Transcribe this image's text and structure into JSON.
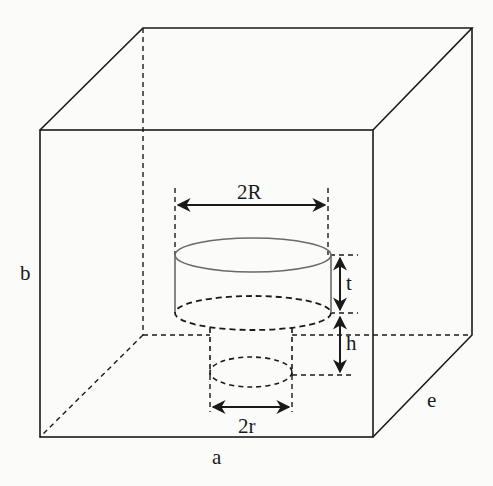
{
  "diagram": {
    "type": "3D box with stepped cylindrical cavity",
    "colors": {
      "line": "#1a1a1a",
      "cylinder_edge": "#6a6a6a",
      "background": "#fbfbfa"
    },
    "labels": {
      "large_diameter": "2R",
      "small_diameter": "2r",
      "thickness": "t",
      "depth": "h",
      "width": "a",
      "height": "b",
      "depth_edge": "e"
    }
  }
}
